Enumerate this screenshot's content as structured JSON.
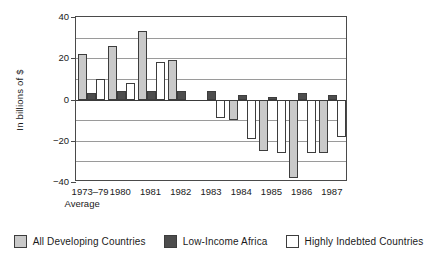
{
  "chart_data": {
    "type": "bar",
    "title": "",
    "subtitle": "",
    "xlabel": "",
    "ylabel": "In billions of $",
    "ylim": [
      -40,
      40
    ],
    "yticks": [
      40,
      20,
      0,
      -20,
      -40
    ],
    "ytick_labels": [
      "40",
      "20",
      "0",
      "−20",
      "−40"
    ],
    "gridlines": [
      30,
      20,
      10,
      0,
      -10,
      -20,
      -30
    ],
    "grid": true,
    "legend_position": "bottom",
    "categories": [
      "1973–79",
      "1980",
      "1981",
      "1982",
      "1983",
      "1984",
      "1985",
      "1986",
      "1987"
    ],
    "category_sublabels": [
      "Average",
      "",
      "",
      "",
      "",
      "",
      "",
      "",
      ""
    ],
    "series": [
      {
        "name": "All Developing Countries",
        "color": "#c9c9c9",
        "values": [
          22,
          26,
          33,
          19,
          0,
          -10,
          -25,
          -38,
          -26
        ]
      },
      {
        "name": "Low-Income Africa",
        "color": "#4d4d4d",
        "values": [
          3,
          4,
          4,
          4,
          4,
          2,
          1,
          3,
          2
        ]
      },
      {
        "name": "Highly Indebted Countries",
        "color": "#ffffff",
        "values": [
          10,
          8,
          18,
          0,
          -9,
          -19,
          -26,
          -26,
          -18
        ]
      }
    ]
  },
  "legend": {
    "items": [
      {
        "label": "All Developing Countries",
        "swatch": "legend-swatch-all-developing"
      },
      {
        "label": "Low-Income Africa",
        "swatch": "legend-swatch-low-income-africa"
      },
      {
        "label": "Highly Indebted Countries",
        "swatch": "legend-swatch-highly-indebted"
      }
    ]
  }
}
